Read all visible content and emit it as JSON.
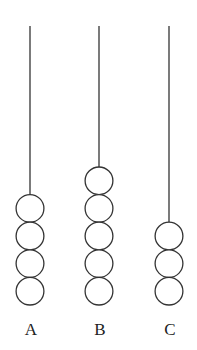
{
  "diagram": {
    "type": "abacus-rods",
    "rods": [
      {
        "label": "A",
        "beads": 4,
        "x": 30
      },
      {
        "label": "B",
        "beads": 5,
        "x": 99
      },
      {
        "label": "C",
        "beads": 3,
        "x": 169
      }
    ],
    "rod_top": 26,
    "base_y": 305,
    "bead_diameter": 27.6,
    "bead_width": 29,
    "stroke_color": "#333333"
  }
}
